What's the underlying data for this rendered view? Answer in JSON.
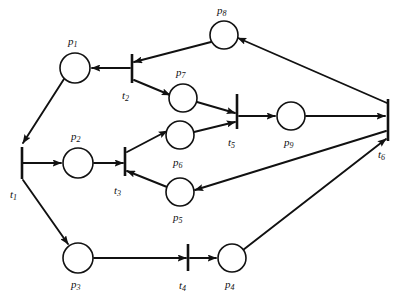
{
  "diagram": {
    "kind": "petri-net",
    "canvas": {
      "width": 407,
      "height": 304,
      "background": "#ffffff"
    },
    "stroke_color": "#111111",
    "places": [
      {
        "id": "p1",
        "label": "p",
        "sub": "1",
        "cx": 75,
        "cy": 68,
        "r": 15,
        "label_x": 68,
        "label_y": 45
      },
      {
        "id": "p2",
        "label": "p",
        "sub": "2",
        "cx": 78,
        "cy": 163,
        "r": 15,
        "label_x": 71,
        "label_y": 140
      },
      {
        "id": "p3",
        "label": "p",
        "sub": "3",
        "cx": 78,
        "cy": 258,
        "r": 15,
        "label_x": 71,
        "label_y": 288
      },
      {
        "id": "p4",
        "label": "p",
        "sub": "4",
        "cx": 232,
        "cy": 258,
        "r": 14,
        "label_x": 225,
        "label_y": 288
      },
      {
        "id": "p5",
        "label": "p",
        "sub": "5",
        "cx": 180,
        "cy": 192,
        "r": 14,
        "label_x": 173,
        "label_y": 221
      },
      {
        "id": "p6",
        "label": "p",
        "sub": "6",
        "cx": 180,
        "cy": 135,
        "r": 14,
        "label_x": 173,
        "label_y": 166
      },
      {
        "id": "p7",
        "label": "p",
        "sub": "7",
        "cx": 183,
        "cy": 98,
        "r": 14,
        "label_x": 176,
        "label_y": 76
      },
      {
        "id": "p8",
        "label": "p",
        "sub": "8",
        "cx": 224,
        "cy": 35,
        "r": 14,
        "label_x": 217,
        "label_y": 14
      },
      {
        "id": "p9",
        "label": "p",
        "sub": "9",
        "cx": 291,
        "cy": 116,
        "r": 14,
        "label_x": 284,
        "label_y": 146
      }
    ],
    "transitions": [
      {
        "id": "t1",
        "label": "t",
        "sub": "1",
        "x": 22,
        "y1": 147,
        "y2": 179,
        "label_x": 10,
        "label_y": 198
      },
      {
        "id": "t2",
        "label": "t",
        "sub": "2",
        "x": 132,
        "y1": 54,
        "y2": 83,
        "label_x": 122,
        "label_y": 99
      },
      {
        "id": "t3",
        "label": "t",
        "sub": "3",
        "x": 125,
        "y1": 147,
        "y2": 176,
        "label_x": 114,
        "label_y": 194
      },
      {
        "id": "t4",
        "label": "t",
        "sub": "4",
        "x": 188,
        "y1": 244,
        "y2": 271,
        "label_x": 179,
        "label_y": 289
      },
      {
        "id": "t5",
        "label": "t",
        "sub": "5",
        "x": 237,
        "y1": 94,
        "y2": 129,
        "label_x": 228,
        "label_y": 146
      },
      {
        "id": "t6",
        "label": "t",
        "sub": "6",
        "x": 388,
        "y1": 99,
        "y2": 141,
        "label_x": 378,
        "label_y": 158
      }
    ],
    "arcs": [
      {
        "from": "p1",
        "to": "t1",
        "x1": 64,
        "y1": 79,
        "x2": 23,
        "y2": 143
      },
      {
        "from": "t1",
        "to": "p2",
        "x1": 23,
        "y1": 163,
        "x2": 61,
        "y2": 163
      },
      {
        "from": "t1",
        "to": "p3",
        "x1": 23,
        "y1": 180,
        "x2": 68,
        "y2": 244
      },
      {
        "from": "p2",
        "to": "t3",
        "x1": 94,
        "y1": 163,
        "x2": 123,
        "y2": 163
      },
      {
        "from": "p3",
        "to": "t4",
        "x1": 94,
        "y1": 258,
        "x2": 186,
        "y2": 258
      },
      {
        "from": "t4",
        "to": "p4",
        "x1": 190,
        "y1": 258,
        "x2": 216,
        "y2": 258
      },
      {
        "from": "t2",
        "to": "p1",
        "x1": 130,
        "y1": 68,
        "x2": 92,
        "y2": 68
      },
      {
        "from": "t2",
        "to": "p7",
        "x1": 134,
        "y1": 80,
        "x2": 170,
        "y2": 95
      },
      {
        "from": "t3",
        "to": "p6",
        "x1": 127,
        "y1": 152,
        "x2": 167,
        "y2": 131
      },
      {
        "from": "p5",
        "to": "t3",
        "x1": 167,
        "y1": 187,
        "x2": 127,
        "y2": 171
      },
      {
        "from": "p7",
        "to": "t5",
        "x1": 197,
        "y1": 102,
        "x2": 235,
        "y2": 113
      },
      {
        "from": "p6",
        "to": "t5",
        "x1": 194,
        "y1": 132,
        "x2": 235,
        "y2": 122
      },
      {
        "from": "t5",
        "to": "p9",
        "x1": 239,
        "y1": 116,
        "x2": 275,
        "y2": 116
      },
      {
        "from": "p9",
        "to": "t6",
        "x1": 306,
        "y1": 116,
        "x2": 385,
        "y2": 116
      },
      {
        "from": "p8",
        "to": "t2",
        "x1": 211,
        "y1": 42,
        "x2": 134,
        "y2": 62
      },
      {
        "from": "t6",
        "to": "p8",
        "x1": 387,
        "y1": 103,
        "x2": 238,
        "y2": 38
      },
      {
        "from": "t6",
        "to": "p5",
        "x1": 386,
        "y1": 131,
        "x2": 195,
        "y2": 190
      },
      {
        "from": "p4",
        "to": "t6",
        "x1": 243,
        "y1": 250,
        "x2": 386,
        "y2": 139
      }
    ]
  }
}
